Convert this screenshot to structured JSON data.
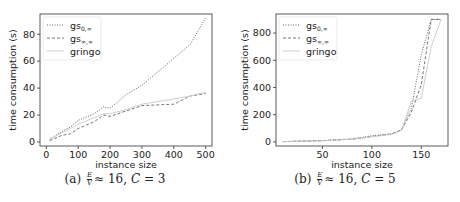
{
  "panels": [
    {
      "caption": {
        "label": "(a)",
        "frac_num": "E",
        "frac_den": "V",
        "rest": "≈ 16, ",
        "var": "C",
        "eq": " = 3"
      },
      "ylabel": "time consumption (s)",
      "xlabel": "instance size",
      "xticks": [
        "0",
        "100",
        "200",
        "300",
        "400",
        "500"
      ],
      "yticks": [
        "0",
        "20",
        "40",
        "60",
        "80"
      ]
    },
    {
      "caption": {
        "label": "(b)",
        "frac_num": "E",
        "frac_den": "V",
        "rest": "≈ 16, ",
        "var": "C",
        "eq": " = 5"
      },
      "ylabel": "time consumption (s)",
      "xlabel": "instance size",
      "xticks": [
        "50",
        "100",
        "150"
      ],
      "yticks": [
        "0",
        "200",
        "400",
        "600",
        "800"
      ]
    }
  ],
  "legend": [
    "gs0,∞",
    "gs∞,∞",
    "gringo"
  ],
  "chart_data": [
    {
      "type": "line",
      "title": "(a) E/V ≈ 16, C = 3",
      "xlabel": "instance size",
      "ylabel": "time consumption (s)",
      "xlim": [
        -20,
        520
      ],
      "ylim": [
        -3,
        95
      ],
      "grid": false,
      "legend_position": "upper left",
      "x": [
        10,
        50,
        75,
        100,
        150,
        180,
        200,
        250,
        300,
        400,
        450,
        500
      ],
      "series": [
        {
          "name": "gs0,∞",
          "style": "dotted",
          "values": [
            2,
            8,
            11,
            16,
            21,
            26,
            25,
            35,
            42,
            62,
            72,
            92
          ]
        },
        {
          "name": "gs∞,∞",
          "style": "dashed",
          "values": [
            1,
            5,
            6,
            10,
            15,
            20,
            19,
            23,
            27,
            28,
            34,
            36
          ]
        },
        {
          "name": "gringo",
          "style": "solid",
          "values": [
            2,
            7,
            10,
            13,
            18,
            21,
            21,
            24,
            28,
            32,
            34,
            37
          ]
        }
      ]
    },
    {
      "type": "line",
      "title": "(b) E/V ≈ 16, C = 5",
      "xlabel": "instance size",
      "ylabel": "time consumption (s)",
      "xlim": [
        3,
        177
      ],
      "ylim": [
        -30,
        940
      ],
      "grid": false,
      "legend_position": "upper left",
      "x": [
        10,
        50,
        80,
        100,
        120,
        130,
        140,
        150,
        160,
        170
      ],
      "series": [
        {
          "name": "gs0,∞",
          "style": "dotted",
          "values": [
            2,
            10,
            22,
            45,
            60,
            90,
            250,
            640,
            900,
            900
          ]
        },
        {
          "name": "gs∞,∞",
          "style": "dashed",
          "values": [
            2,
            10,
            20,
            40,
            58,
            88,
            220,
            420,
            900,
            900
          ]
        },
        {
          "name": "gringo",
          "style": "solid",
          "values": [
            2,
            8,
            20,
            38,
            55,
            85,
            300,
            320,
            700,
            900
          ]
        }
      ]
    }
  ]
}
